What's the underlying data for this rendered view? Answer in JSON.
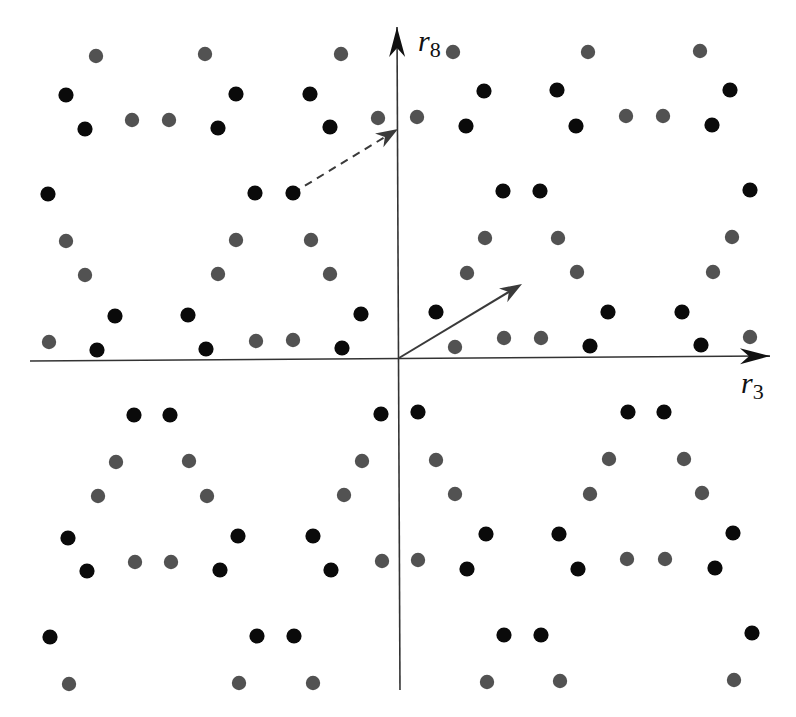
{
  "diagram": {
    "title": "",
    "axes": {
      "horizontal": {
        "label": "r",
        "subscript": "3",
        "from": [
          30,
          361
        ],
        "to": [
          770,
          356
        ]
      },
      "vertical": {
        "label": "r",
        "subscript": "8",
        "from": [
          400,
          690
        ],
        "to": [
          397,
          27
        ]
      }
    },
    "colors": {
      "black_dot": "#0a0a0a",
      "gray_dot": "#525252",
      "axis": "#333333",
      "arrow": "#3a3a3a"
    },
    "vectors": [
      {
        "name": "solid-vector",
        "from": [
          399,
          358
        ],
        "to": [
          522,
          284
        ],
        "style": "solid"
      },
      {
        "name": "dashed-vector",
        "from": [
          293,
          193
        ],
        "to": [
          398,
          129
        ],
        "style": "dashed"
      }
    ],
    "black_dots": [
      [
        66,
        95
      ],
      [
        236,
        94
      ],
      [
        310,
        94
      ],
      [
        85,
        129
      ],
      [
        218,
        128
      ],
      [
        330,
        127
      ],
      [
        48,
        194
      ],
      [
        255,
        193
      ],
      [
        293,
        193
      ],
      [
        115,
        316
      ],
      [
        188,
        315
      ],
      [
        361,
        314
      ],
      [
        97,
        350
      ],
      [
        206,
        349
      ],
      [
        342,
        348
      ],
      [
        484,
        91
      ],
      [
        557,
        90
      ],
      [
        730,
        90
      ],
      [
        466,
        126
      ],
      [
        576,
        126
      ],
      [
        712,
        125
      ],
      [
        503,
        191
      ],
      [
        540,
        191
      ],
      [
        750,
        190
      ],
      [
        436,
        312
      ],
      [
        608,
        312
      ],
      [
        682,
        312
      ],
      [
        590,
        346
      ],
      [
        701,
        345
      ],
      [
        134,
        415
      ],
      [
        170,
        415
      ],
      [
        381,
        414
      ],
      [
        68,
        538
      ],
      [
        238,
        536
      ],
      [
        313,
        536
      ],
      [
        87,
        571
      ],
      [
        220,
        570
      ],
      [
        331,
        570
      ],
      [
        50,
        637
      ],
      [
        257,
        636
      ],
      [
        294,
        636
      ],
      [
        418,
        412
      ],
      [
        628,
        412
      ],
      [
        664,
        412
      ],
      [
        486,
        534
      ],
      [
        559,
        534
      ],
      [
        733,
        533
      ],
      [
        467,
        569
      ],
      [
        578,
        569
      ],
      [
        715,
        568
      ],
      [
        504,
        635
      ],
      [
        541,
        635
      ],
      [
        752,
        633
      ]
    ],
    "gray_dots": [
      [
        96,
        56
      ],
      [
        205,
        54
      ],
      [
        341,
        54
      ],
      [
        132,
        120
      ],
      [
        169,
        120
      ],
      [
        378,
        118
      ],
      [
        66,
        241
      ],
      [
        236,
        240
      ],
      [
        311,
        240
      ],
      [
        85,
        275
      ],
      [
        218,
        274
      ],
      [
        330,
        274
      ],
      [
        49,
        342
      ],
      [
        256,
        341
      ],
      [
        293,
        340
      ],
      [
        453,
        52
      ],
      [
        588,
        52
      ],
      [
        700,
        51
      ],
      [
        417,
        117
      ],
      [
        626,
        116
      ],
      [
        663,
        116
      ],
      [
        485,
        238
      ],
      [
        558,
        238
      ],
      [
        732,
        237
      ],
      [
        467,
        273
      ],
      [
        577,
        272
      ],
      [
        713,
        272
      ],
      [
        455,
        347
      ],
      [
        504,
        338
      ],
      [
        541,
        338
      ],
      [
        750,
        337
      ],
      [
        116,
        462
      ],
      [
        189,
        461
      ],
      [
        362,
        461
      ],
      [
        98,
        496
      ],
      [
        207,
        496
      ],
      [
        344,
        495
      ],
      [
        135,
        562
      ],
      [
        171,
        562
      ],
      [
        382,
        561
      ],
      [
        69,
        684
      ],
      [
        239,
        683
      ],
      [
        313,
        683
      ],
      [
        436,
        460
      ],
      [
        609,
        459
      ],
      [
        684,
        459
      ],
      [
        455,
        494
      ],
      [
        590,
        494
      ],
      [
        702,
        493
      ],
      [
        418,
        560
      ],
      [
        627,
        559
      ],
      [
        665,
        559
      ],
      [
        487,
        682
      ],
      [
        560,
        681
      ],
      [
        734,
        680
      ]
    ]
  }
}
